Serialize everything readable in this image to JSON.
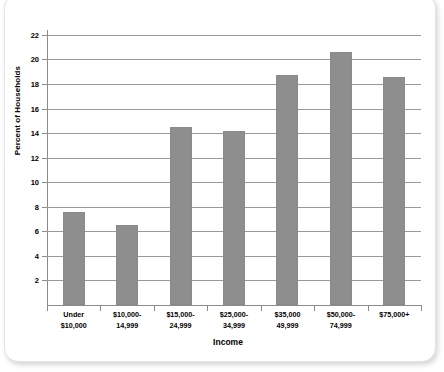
{
  "chart_data": {
    "type": "bar",
    "title": "",
    "xlabel": "Income",
    "ylabel": "Percent of Households",
    "categories": [
      "Under $10,000",
      "$10,000-14,999",
      "$15,000-24,999",
      "$25,000-34,999",
      "$35,000 49,999",
      "$50,000-74,999",
      "$75,000+"
    ],
    "category_lines": [
      [
        "Under",
        "$10,000"
      ],
      [
        "$10,000-",
        "14,999"
      ],
      [
        "$15,000-",
        "24,999"
      ],
      [
        "$25,000-",
        "34,999"
      ],
      [
        "$35,000",
        "49,999"
      ],
      [
        "$50,000-",
        "74,999"
      ],
      [
        "$75,000+",
        ""
      ]
    ],
    "values": [
      7.6,
      6.5,
      14.5,
      14.2,
      18.7,
      20.6,
      18.6
    ],
    "ylim": [
      0,
      22.4
    ],
    "yticks": [
      2,
      4,
      6,
      8,
      10,
      12,
      14,
      16,
      18,
      20,
      22
    ],
    "ytick_labels": [
      "2",
      "4",
      "6",
      "8",
      "10",
      "12",
      "14",
      "16",
      "18",
      "20",
      "22"
    ],
    "grid": "horizontal",
    "legend": "none",
    "bar_color": "#8e8e8e",
    "gridline_color": "#9a9a9a",
    "axis_color": "#8b8b8b",
    "background_color": "#ffffff"
  }
}
